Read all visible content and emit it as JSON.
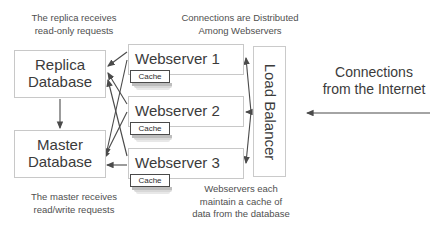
{
  "diagram": {
    "colors": {
      "background": "#ffffff",
      "box_border": "#c8c8c8",
      "cache_border": "#4a4a4a",
      "text": "#3b3b3b",
      "caption_text": "#4f4f4f",
      "arrow": "#4a4a4a"
    },
    "databases": [
      {
        "id": "replica-database",
        "line1": "Replica",
        "line2": "Database"
      },
      {
        "id": "master-database",
        "line1": "Master",
        "line2": "Database"
      }
    ],
    "webservers": [
      {
        "id": "webserver-1",
        "label": "Webserver 1",
        "cache_label": "Cache"
      },
      {
        "id": "webserver-2",
        "label": "Webserver 2",
        "cache_label": "Cache"
      },
      {
        "id": "webserver-3",
        "label": "Webserver 3",
        "cache_label": "Cache"
      }
    ],
    "load_balancer": {
      "label": "Load Balancer"
    },
    "captions": {
      "replica": "The replica receives\nread-only requests",
      "master": "The master receives\nread/write requests",
      "distribution": "Connections are Distributed\nAmong Webservers",
      "cache": "Webservers each\nmaintain a cache of\ndata from the database",
      "internet": "Connections\nfrom the Internet"
    }
  }
}
